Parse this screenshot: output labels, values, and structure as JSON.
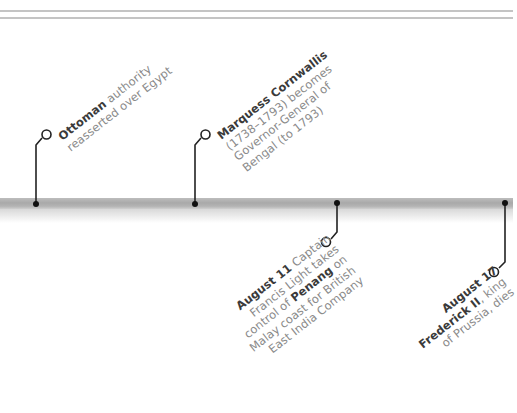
{
  "page": {
    "type": "historical-timeline",
    "colors": {
      "text_bold": "#3a3a3a",
      "text_regular": "#8a8a8a",
      "connector": "#222222",
      "timeline_bar": "#b0b0b0",
      "rule": "#c4c4c4"
    }
  },
  "events": [
    {
      "position": "above",
      "bold": "Ottoman",
      "lines": [
        "authority",
        "reasserted over Egypt"
      ]
    },
    {
      "position": "above",
      "bold": "Marquess Cornwallis",
      "lines": [
        "(1738–1793) becomes",
        "Governor-General of",
        "Bengal (to 1793)"
      ]
    },
    {
      "position": "below",
      "bold": "August 11",
      "line1_rest": "Captain",
      "line2": "Francis Light takes",
      "line3_pre": "control of ",
      "line3_bold": "Penang",
      "line3_post": " on",
      "line4": "Malay coast for British",
      "line5": "East India Company"
    },
    {
      "position": "below",
      "bold": "August 17",
      "line2_bold": "Frederick II",
      "line2_rest": ", king",
      "line3": "of Prussia, dies"
    }
  ]
}
